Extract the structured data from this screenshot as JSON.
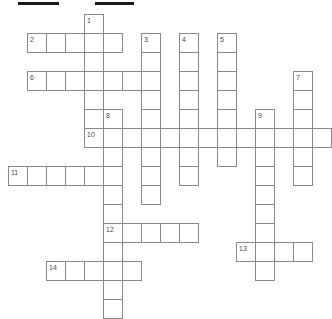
{
  "puzzle": {
    "title": "crossword-grid",
    "cell_size": 19,
    "origin": {
      "x": 8,
      "y": 14
    },
    "colors": {
      "cell_border": "#8a8a8a",
      "cell_fill": "#ffffff",
      "bar": "#1b1b1b",
      "number": "#4a4a4a",
      "page": "#ffffff"
    },
    "top_bars": [
      {
        "name": "redaction-bar-left",
        "x": 18,
        "y": 2,
        "width": 41,
        "height": 3
      },
      {
        "name": "redaction-bar-right",
        "x": 95,
        "y": 2,
        "width": 39,
        "height": 3
      }
    ],
    "entries": [
      {
        "number": "1",
        "direction": "down",
        "col": 4,
        "row": 0,
        "length": 7
      },
      {
        "number": "2",
        "direction": "across",
        "col": 1,
        "row": 1,
        "length": 5
      },
      {
        "number": "3",
        "direction": "down",
        "col": 7,
        "row": 1,
        "length": 9
      },
      {
        "number": "4",
        "direction": "down",
        "col": 9,
        "row": 1,
        "length": 8
      },
      {
        "number": "5",
        "direction": "down",
        "col": 11,
        "row": 1,
        "length": 7
      },
      {
        "number": "6",
        "direction": "across",
        "col": 1,
        "row": 3,
        "length": 7
      },
      {
        "number": "7",
        "direction": "down",
        "col": 15,
        "row": 3,
        "length": 6
      },
      {
        "number": "8",
        "direction": "down",
        "col": 5,
        "row": 5,
        "length": 11
      },
      {
        "number": "9",
        "direction": "down",
        "col": 13,
        "row": 5,
        "length": 9
      },
      {
        "number": "10",
        "direction": "across",
        "col": 4,
        "row": 6,
        "length": 13
      },
      {
        "number": "11",
        "direction": "across",
        "col": 0,
        "row": 8,
        "length": 5
      },
      {
        "number": "12",
        "direction": "across",
        "col": 5,
        "row": 11,
        "length": 5
      },
      {
        "number": "13",
        "direction": "across",
        "col": 12,
        "row": 12,
        "length": 4
      },
      {
        "number": "14",
        "direction": "across",
        "col": 2,
        "row": 13,
        "length": 5
      }
    ]
  }
}
